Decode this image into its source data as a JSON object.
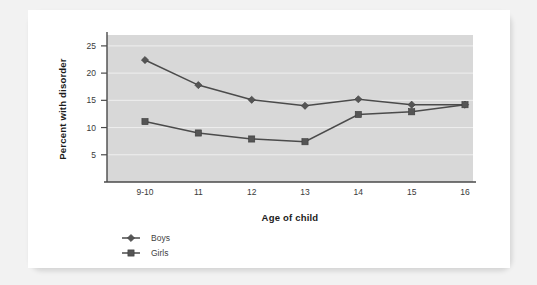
{
  "card": {
    "background_color": "#ffffff",
    "page_background_color": "#f2f2f2"
  },
  "chart_data": {
    "type": "line",
    "title": "",
    "subtitle": "",
    "xlabel": "Age of child",
    "ylabel": "Percent with disorder",
    "categories": [
      "9-10",
      "11",
      "12",
      "13",
      "14",
      "15",
      "16"
    ],
    "x_tick_labels": [
      "9-10",
      "11",
      "12",
      "13",
      "14",
      "15",
      "16"
    ],
    "y_tick_labels": [
      "5",
      "10",
      "15",
      "20",
      "25"
    ],
    "y_ticks": [
      5,
      10,
      15,
      20,
      25
    ],
    "ylim": [
      0,
      27
    ],
    "grid": "horizontal",
    "legend_position": "below-left",
    "plot_background_color": "#d8d8d8",
    "gridline_color": "#efefef",
    "axis_color": "#4a4a4a",
    "series": [
      {
        "name": "Boys",
        "marker": "diamond",
        "color": "#555555",
        "values": [
          22.4,
          17.8,
          15.1,
          14.0,
          15.2,
          14.2,
          14.2
        ]
      },
      {
        "name": "Girls",
        "marker": "square",
        "color": "#555555",
        "values": [
          11.1,
          9.0,
          7.9,
          7.4,
          12.4,
          12.9,
          14.2
        ]
      }
    ]
  },
  "legend": {
    "entries": [
      {
        "label": "Boys",
        "marker": "diamond"
      },
      {
        "label": "Girls",
        "marker": "square"
      }
    ]
  }
}
